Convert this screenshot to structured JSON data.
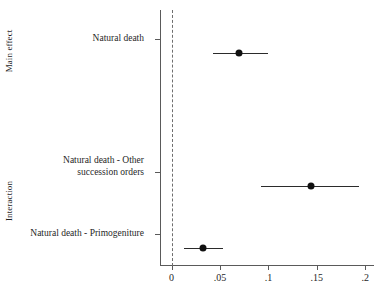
{
  "chart_data": {
    "type": "scatter",
    "title": "",
    "subtitle": "",
    "xlabel": "",
    "ylabel": "",
    "orientation": "horizontal",
    "xlim": [
      -0.012,
      0.209
    ],
    "xticks": [
      0,
      0.05,
      0.1,
      0.15,
      0.2
    ],
    "xticklabels": [
      "0",
      ".05",
      ".1",
      ".15",
      ".2"
    ],
    "grid": false,
    "legend": null,
    "reference_line": {
      "value": 0,
      "style": "dashed",
      "color": "#6e6e6e"
    },
    "groups": [
      {
        "name": "Main effect",
        "label": "Main effect"
      },
      {
        "name": "Interaction",
        "label": "Interaction"
      }
    ],
    "categories": [
      "Natural death",
      "Natural death - Other succession orders",
      "Natural death - Primogeniture"
    ],
    "points": [
      {
        "group": "Main effect",
        "label_lines": [
          "Natural death"
        ],
        "estimate": 0.07,
        "ci_low": 0.043,
        "ci_high": 0.1
      },
      {
        "group": "Interaction",
        "label_lines": [
          "Natural death - Other",
          "succession orders"
        ],
        "estimate": 0.144,
        "ci_low": 0.092,
        "ci_high": 0.194
      },
      {
        "group": "Interaction",
        "label_lines": [
          "Natural death - Primogeniture"
        ],
        "estimate": 0.032,
        "ci_low": 0.013,
        "ci_high": 0.053
      }
    ],
    "colors": {
      "point": "#111111",
      "ci": "#2b2b2b",
      "axis": "#5a5a5a",
      "reference": "#6e6e6e",
      "background": "#ffffff",
      "text": "#1f1f1f"
    }
  },
  "axis": {
    "y_group_main": "Main effect",
    "y_group_interaction": "Interaction",
    "y_label_1_line1": "Natural death",
    "y_label_2_line1": "Natural death - Other",
    "y_label_2_line2": "succession orders",
    "y_label_3_line1": "Natural death - Primogeniture",
    "x_tick_0": "0",
    "x_tick_1": ".05",
    "x_tick_2": ".1",
    "x_tick_3": ".15",
    "x_tick_4": ".2"
  }
}
